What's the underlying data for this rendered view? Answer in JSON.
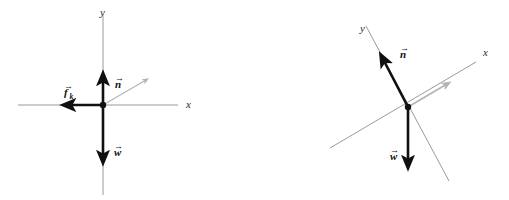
{
  "figure": {
    "background_color": "#ffffff",
    "panels": [
      {
        "id": "left-panel",
        "name": "horizontal-axes-diagram",
        "description": "Free-body diagram with standard horizontal x-axis and vertical y-axis",
        "origin": {
          "x": 103,
          "y": 105
        },
        "axes": [
          {
            "name": "x-axis",
            "label": "x",
            "label_x": 186,
            "label_y": 108,
            "x1": 18,
            "y1": 105,
            "x2": 178,
            "y2": 105,
            "color": "#8f8f8f"
          },
          {
            "name": "y-axis",
            "label": "y",
            "label_x": 100,
            "label_y": 16,
            "x1": 103,
            "y1": 14,
            "x2": 103,
            "y2": 195,
            "color": "#8f8f8f"
          }
        ],
        "vectors": [
          {
            "name": "friction-vector",
            "label": "f",
            "subscript": "k",
            "label_x": 64,
            "label_y": 96,
            "x1": 103,
            "y1": 105,
            "x2": 68,
            "y2": 105,
            "color": "#101010",
            "width": 2.6,
            "style": "bold"
          },
          {
            "name": "normal-force-vector",
            "label": "n",
            "subscript": "",
            "label_x": 115,
            "label_y": 88,
            "x1": 103,
            "y1": 105,
            "x2": 103,
            "y2": 78,
            "color": "#101010",
            "width": 2.6,
            "style": "bold"
          },
          {
            "name": "weight-vector",
            "label": "w",
            "subscript": "",
            "label_x": 114,
            "label_y": 156,
            "x1": 103,
            "y1": 105,
            "x2": 103,
            "y2": 158,
            "color": "#101010",
            "width": 2.6,
            "style": "bold"
          },
          {
            "name": "resultant-guide-vector",
            "label": "",
            "subscript": "",
            "label_x": 0,
            "label_y": 0,
            "x1": 103,
            "y1": 105,
            "x2": 146,
            "y2": 80,
            "color": "#b3b3b3",
            "width": 1.1,
            "style": "faint"
          }
        ]
      },
      {
        "id": "right-panel",
        "name": "rotated-axes-diagram",
        "description": "Free-body diagram with tilted x-axis and tilted y-axis for an inclined plane",
        "origin": {
          "x": 408,
          "y": 107
        },
        "axes": [
          {
            "name": "x-axis",
            "label": "x",
            "label_x": 483,
            "label_y": 56,
            "x1": 330,
            "y1": 148,
            "x2": 476,
            "y2": 62,
            "color": "#8f8f8f"
          },
          {
            "name": "y-axis",
            "label": "y",
            "label_x": 360,
            "label_y": 32,
            "x1": 366,
            "y1": 26,
            "x2": 449,
            "y2": 181,
            "color": "#8f8f8f"
          }
        ],
        "vectors": [
          {
            "name": "normal-force-vector",
            "label": "n",
            "subscript": "",
            "label_x": 400,
            "label_y": 58,
            "x1": 408,
            "y1": 107,
            "x2": 383,
            "y2": 59,
            "color": "#101010",
            "width": 2.6,
            "style": "bold"
          },
          {
            "name": "weight-vector",
            "label": "w",
            "subscript": "",
            "label_x": 390,
            "label_y": 160,
            "x1": 408,
            "y1": 107,
            "x2": 408,
            "y2": 163,
            "color": "#101010",
            "width": 2.6,
            "style": "bold"
          },
          {
            "name": "friction-guide-vector",
            "label": "",
            "subscript": "",
            "label_x": 0,
            "label_y": 0,
            "x1": 408,
            "y1": 107,
            "x2": 447,
            "y2": 84,
            "color": "#b3b3b3",
            "width": 1.6,
            "style": "faint"
          }
        ]
      }
    ]
  }
}
